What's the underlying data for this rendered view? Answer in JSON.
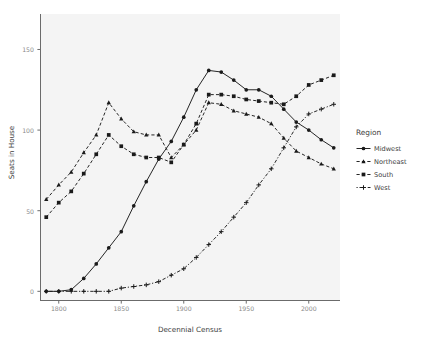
{
  "chart_data": {
    "type": "line",
    "title": "",
    "xlabel": "Decennial Census",
    "ylabel": "Seats in House",
    "xlim": [
      1785,
      2025
    ],
    "ylim": [
      -6,
      172
    ],
    "xticks": [
      1800,
      1850,
      1900,
      1950,
      2000
    ],
    "yticks": [
      0,
      50,
      100,
      150
    ],
    "grid": false,
    "legend_position": "right",
    "legend_title": "Region",
    "x": [
      1790,
      1800,
      1810,
      1820,
      1830,
      1840,
      1850,
      1860,
      1870,
      1880,
      1890,
      1900,
      1910,
      1920,
      1930,
      1940,
      1950,
      1960,
      1970,
      1980,
      1990,
      2000,
      2010,
      2020
    ],
    "series": [
      {
        "name": "Midwest",
        "marker": "circle",
        "linetype": "solid",
        "values": [
          0,
          0,
          1,
          8,
          17,
          27,
          37,
          53,
          68,
          82,
          93,
          108,
          125,
          137,
          136,
          131,
          125,
          125,
          121,
          113,
          105,
          100,
          94,
          89
        ]
      },
      {
        "name": "Northeast",
        "marker": "triangle",
        "linetype": "dashed",
        "values": [
          57,
          66,
          74,
          86,
          97,
          117,
          107,
          99,
          97,
          97,
          83,
          91,
          100,
          117,
          116,
          112,
          110,
          108,
          104,
          95,
          87,
          83,
          79,
          76
        ]
      },
      {
        "name": "South",
        "marker": "square",
        "linetype": "dashed",
        "values": [
          46,
          55,
          62,
          73,
          85,
          97,
          90,
          85,
          83,
          83,
          80,
          91,
          104,
          122,
          122,
          121,
          119,
          118,
          117,
          116,
          121,
          128,
          131,
          134
        ]
      },
      {
        "name": "West",
        "marker": "plus",
        "linetype": "dotdash",
        "values": [
          0,
          0,
          0,
          0,
          0,
          0,
          2,
          3,
          4,
          6,
          10,
          14,
          21,
          29,
          37,
          46,
          55,
          66,
          76,
          89,
          102,
          110,
          113,
          116
        ]
      }
    ]
  },
  "axis": {
    "y_tick_labels": [
      "0",
      "50",
      "100",
      "150"
    ],
    "x_tick_labels": [
      "1800",
      "1850",
      "1900",
      "1950",
      "2000"
    ],
    "y_title": "Seats in House",
    "x_title": "Decennial Census"
  },
  "legend": {
    "title": "Region",
    "items": [
      {
        "label": "Midwest"
      },
      {
        "label": "Northeast"
      },
      {
        "label": "South"
      },
      {
        "label": "West"
      }
    ]
  },
  "colors": {
    "panel_background": "#f4f4f4",
    "page_background": "#ffffff",
    "axis_line": "#6b6b6b",
    "tick_label": "#8a8a8a",
    "axis_title": "#3d3d3d",
    "series": "#1a1a1a"
  }
}
